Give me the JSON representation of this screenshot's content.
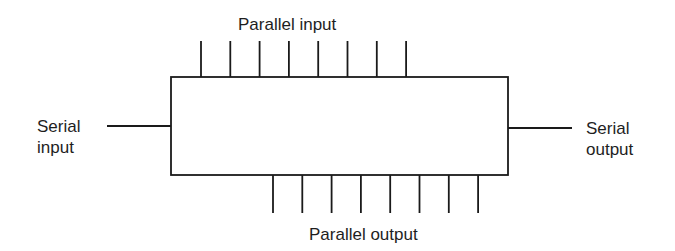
{
  "diagram": {
    "block": {
      "name": "register"
    },
    "labels": {
      "parallel_input": "Parallel input",
      "parallel_output": "Parallel output",
      "serial_input_line1": "Serial",
      "serial_input_line2": "input",
      "serial_output_line1": "Serial",
      "serial_output_line2": "output"
    },
    "parallel_input_count": 8,
    "parallel_output_count": 8,
    "colors": {
      "line": "#1a1a1a",
      "text": "#1e1e1e",
      "background": "#ffffff"
    }
  }
}
